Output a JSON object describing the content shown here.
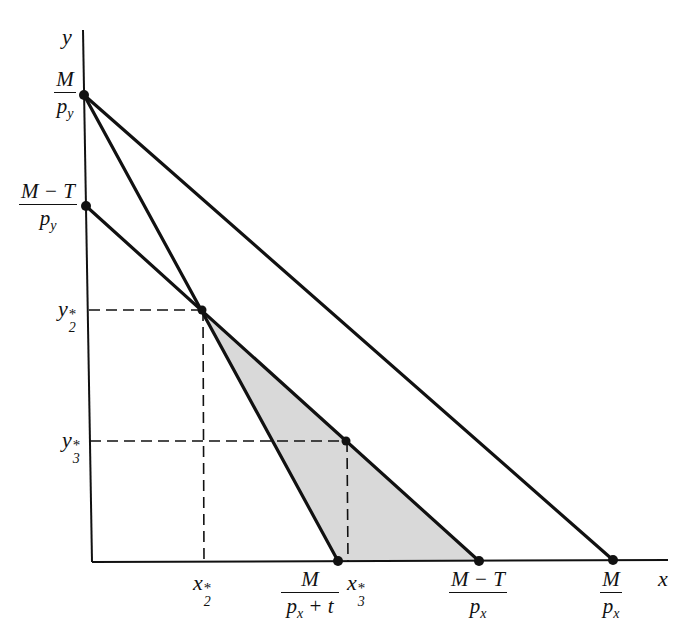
{
  "diagram": {
    "colors": {
      "ink": "#111111",
      "shade": "#d9d9d9",
      "background": "#ffffff"
    },
    "axes": {
      "x_label": "x",
      "y_label": "y",
      "origin": [
        92,
        562
      ],
      "x_end": [
        668,
        560
      ],
      "y_top": [
        83,
        30
      ]
    },
    "y_ticks": [
      {
        "id": "M_over_py",
        "num": "M",
        "den_main": "p",
        "den_sub": "y",
        "point": [
          84,
          95
        ]
      },
      {
        "id": "MT_over_py",
        "num": "M − T",
        "den_main": "p",
        "den_sub": "y",
        "point": [
          86,
          206
        ]
      },
      {
        "id": "y2star",
        "main": "y",
        "sub": "2",
        "star": "*",
        "y": 310
      },
      {
        "id": "y3star",
        "main": "y",
        "sub": "3",
        "star": "*",
        "y": 441
      }
    ],
    "x_ticks": [
      {
        "id": "x2star",
        "main": "x",
        "sub": "2",
        "star": "*",
        "x": 203
      },
      {
        "id": "M_over_px_plus_t",
        "num": "M",
        "den_main": "p",
        "den_sub": "x",
        "den_tail": " + t",
        "point": [
          338,
          561
        ]
      },
      {
        "id": "x3star",
        "main": "x",
        "sub": "3",
        "star": "*",
        "x": 347
      },
      {
        "id": "MT_over_px",
        "num": "M − T",
        "den_main": "p",
        "den_sub": "x",
        "point": [
          479,
          561
        ]
      },
      {
        "id": "M_over_px",
        "num": "M",
        "den_main": "p",
        "den_sub": "x",
        "point": [
          613,
          560
        ]
      }
    ],
    "lines": [
      {
        "name": "original-budget-line",
        "from": [
          84,
          95
        ],
        "to": [
          613,
          560
        ]
      },
      {
        "name": "excise-tax-budget-line",
        "from": [
          84,
          95
        ],
        "to": [
          338,
          561
        ]
      },
      {
        "name": "lump-sum-tax-budget-line",
        "from": [
          86,
          206
        ],
        "to": [
          479,
          561
        ]
      }
    ],
    "points": [
      {
        "name": "optimum-2",
        "at": [
          202,
          310
        ]
      },
      {
        "name": "optimum-3",
        "at": [
          346,
          441
        ]
      }
    ],
    "shaded_region": [
      [
        202,
        310
      ],
      [
        338,
        561
      ],
      [
        479,
        561
      ]
    ]
  }
}
